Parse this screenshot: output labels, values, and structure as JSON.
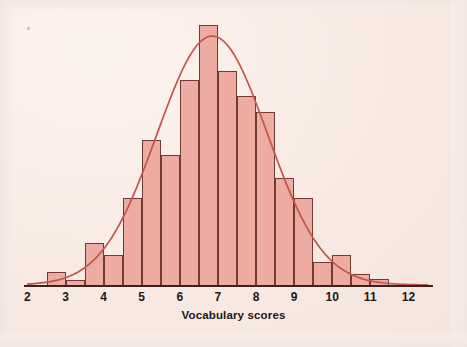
{
  "figure": {
    "background_color": "#f7ece7",
    "bar_fill_color": "#eeaba2",
    "bar_edge_color": "#6f3b34",
    "curve_color": "#c0564a",
    "axis_color": "#3a2220",
    "text_color": "#231614"
  },
  "chart_data": {
    "type": "bar",
    "title": "",
    "subtitle": "",
    "xlabel": "Vocabulary scores",
    "ylabel": "",
    "grid": false,
    "legend": null,
    "xlim": [
      2,
      12.5
    ],
    "ylim": [
      0,
      260
    ],
    "xticks": [
      2,
      3,
      4,
      5,
      6,
      7,
      8,
      9,
      10,
      11,
      12
    ],
    "xtick_labels": [
      "2",
      "3",
      "4",
      "5",
      "6",
      "7",
      "8",
      "9",
      "10",
      "11",
      "12"
    ],
    "yticks": [],
    "ytick_labels": [],
    "bin_width": 0.5,
    "bin_edges": [
      2.5,
      3.0,
      3.5,
      4.0,
      4.5,
      5.0,
      5.5,
      6.0,
      6.5,
      7.0,
      7.5,
      8.0,
      8.5,
      9.0,
      9.5,
      10.0,
      10.5,
      11.0,
      11.5
    ],
    "categories": [
      "2.5-3.0",
      "3.0-3.5",
      "3.5-4.0",
      "4.0-4.5",
      "4.5-5.0",
      "5.0-5.5",
      "5.5-6.0",
      "6.0-6.5",
      "6.5-7.0",
      "7.0-7.5",
      "7.5-8.0",
      "8.0-8.5",
      "8.5-9.0",
      "9.0-9.5",
      "9.5-10.0",
      "10.0-10.5",
      "10.5-11.0",
      "11.0-11.5"
    ],
    "values": [
      13,
      5,
      42,
      30,
      87,
      145,
      130,
      205,
      260,
      214,
      189,
      173,
      107,
      87,
      23,
      30,
      11,
      6
    ],
    "overlay": {
      "type": "line",
      "name": "normal density curve",
      "mean": 6.85,
      "sigma": 1.45,
      "peak_value": 249
    }
  },
  "annotations": {
    "x_axis_caption": "Vocabulary scores"
  }
}
